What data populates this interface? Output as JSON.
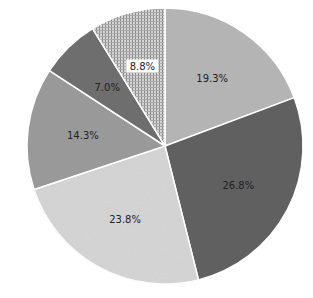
{
  "chart_data": {
    "type": "pie",
    "title": "",
    "start_angle_deg": 0,
    "direction": "clockwise",
    "slices": [
      {
        "label": "19.3%",
        "value": 19.3,
        "color": "#b4b4b4",
        "pattern": "solid"
      },
      {
        "label": "26.8%",
        "value": 26.8,
        "color": "#606060",
        "pattern": "solid"
      },
      {
        "label": "23.8%",
        "value": 23.8,
        "color": "#cfcfcf",
        "pattern": "speckled"
      },
      {
        "label": "14.3%",
        "value": 14.3,
        "color": "#999999",
        "pattern": "solid"
      },
      {
        "label": "7.0%",
        "value": 7.0,
        "color": "#6e6e6e",
        "pattern": "solid"
      },
      {
        "label": "8.8%",
        "value": 8.8,
        "color": "#b8b8b8",
        "pattern": "grid-hatch",
        "label_boxed": true
      }
    ],
    "legend": null
  },
  "geometry": {
    "cx": 165,
    "cy": 146,
    "r": 138
  }
}
